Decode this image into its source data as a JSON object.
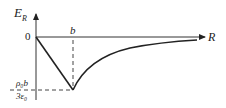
{
  "diagram": {
    "y_axis_label": "E",
    "y_axis_label_sub": "R",
    "x_axis_label": "R",
    "origin_label": "0",
    "b_label": "b",
    "min_value_numerator": "ρ₀b",
    "min_value_denominator": "3ε₀",
    "colors": {
      "line": "#222222",
      "axis": "#333333",
      "dashed": "#444444"
    }
  }
}
